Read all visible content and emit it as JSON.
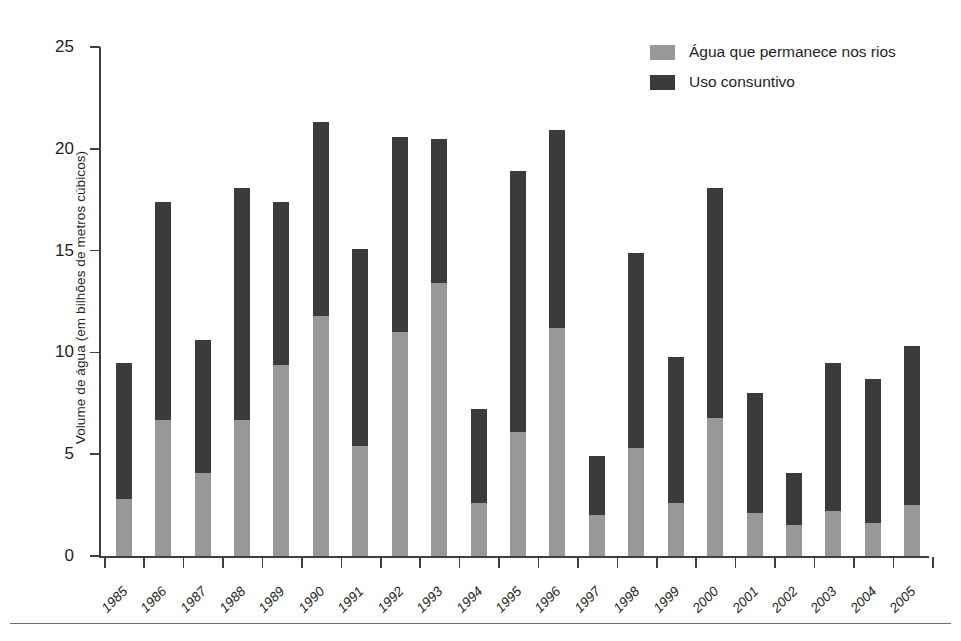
{
  "chart_data": {
    "type": "bar",
    "subtype": "stacked-vertical",
    "title": "",
    "xlabel": "",
    "ylabel": "Volume de água (em bilhões de metros cúbicos)",
    "ylim": [
      0,
      25
    ],
    "yticks": [
      0,
      5,
      10,
      15,
      20,
      25
    ],
    "grid": false,
    "legend_position": "top-right",
    "categories": [
      "1985",
      "1986",
      "1987",
      "1988",
      "1989",
      "1990",
      "1991",
      "1992",
      "1993",
      "1994",
      "1995",
      "1996",
      "1997",
      "1998",
      "1999",
      "2000",
      "2001",
      "2002",
      "2003",
      "2004",
      "2005"
    ],
    "series": [
      {
        "name": "Água que permanece nos rios",
        "color": "#989898",
        "values": [
          2.8,
          6.7,
          4.1,
          6.7,
          9.4,
          11.8,
          5.4,
          11.0,
          13.4,
          2.6,
          6.1,
          11.2,
          2.0,
          5.3,
          2.6,
          6.8,
          2.1,
          1.5,
          2.2,
          1.6,
          2.5
        ]
      },
      {
        "name": "Uso consuntivo",
        "color": "#3c3b3b",
        "values": [
          6.7,
          10.7,
          6.5,
          11.4,
          8.0,
          9.5,
          9.7,
          9.6,
          7.1,
          4.6,
          12.8,
          9.7,
          2.9,
          9.6,
          7.2,
          11.3,
          5.9,
          2.6,
          7.3,
          7.1,
          7.8
        ]
      }
    ],
    "totals": [
      9.5,
      17.4,
      10.6,
      18.1,
      17.4,
      21.3,
      15.1,
      20.6,
      20.5,
      7.2,
      18.9,
      20.9,
      4.9,
      14.9,
      9.8,
      18.1,
      8.0,
      4.1,
      9.5,
      8.7,
      10.3
    ]
  },
  "legend": {
    "items": [
      {
        "label": "Água que permanece nos rios",
        "color": "#989898"
      },
      {
        "label": "Uso consuntivo",
        "color": "#3c3b3b"
      }
    ]
  },
  "axis": {
    "y_title": "Volume de água (em bilhões de metros cúbicos)",
    "y_tick_labels": [
      "0",
      "5",
      "10",
      "15",
      "20",
      "25"
    ],
    "x_tick_labels": [
      "1985",
      "1986",
      "1987",
      "1988",
      "1989",
      "1990",
      "1991",
      "1992",
      "1993",
      "1994",
      "1995",
      "1996",
      "1997",
      "1998",
      "1999",
      "2000",
      "2001",
      "2002",
      "2003",
      "2004",
      "2005"
    ]
  },
  "colors": {
    "series_gray": "#989898",
    "series_dark": "#3c3b3b",
    "axis": "#3f3f3f",
    "text": "#231f20",
    "background": "#ffffff"
  }
}
